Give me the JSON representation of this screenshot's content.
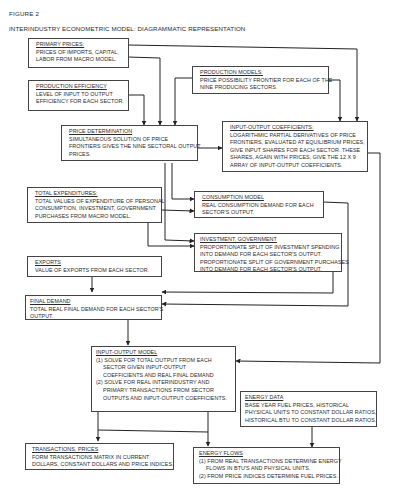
{
  "figure": {
    "label": "FIGURE 2",
    "title": "INTERINDUSTRY ECONOMETRIC MODEL: DIAGRAMMATIC REPRESENTATION"
  },
  "boxes": {
    "primary_prices": {
      "header": "PRIMARY PRICES:",
      "lines": [
        "PRICES OF IMPORTS, CAPITAL,",
        "LABOR FROM MACRO MODEL."
      ]
    },
    "production_efficiency": {
      "header": "PRODUCTION EFFICIENCY",
      "lines": [
        "LEVEL OF INPUT TO OUTPUT",
        "EFFICIENCY FOR EACH SECTOR."
      ]
    },
    "production_models": {
      "header": "PRODUCTION MODELS:",
      "lines": [
        "PRICE POSSIBILITY FRONTIER FOR EACH OF THE",
        "NINE PRODUCING SECTORS."
      ]
    },
    "price_determination": {
      "header": "PRICE DETERMINATION",
      "lines": [
        "SIMULTANEOUS SOLUTION OF PRICE",
        "FRONTIERS GIVES THE NINE SECTORAL OUTPUT",
        "PRICES."
      ]
    },
    "input_output_coefficients": {
      "header": "INPUT-OUTPUT COEFFICIENTS:",
      "lines": [
        "LOGARITHMIC PARTIAL DERIVATIVES OF PRICE",
        "FRONTIERS, EVALUATED AT EQUILIBRIUM PRICES,",
        "GIVE INPUT SHARES FOR EACH SECTOR. THESE",
        "SHARES, AGAIN WITH PRICES, GIVE THE 12 x 9",
        "ARRAY OF INPUT-OUTPUT COEFFICIENTS."
      ]
    },
    "total_expenditures": {
      "header": "TOTAL EXPENDITURES:",
      "lines": [
        "TOTAL VALUES OF EXPENDITURE OF PERSONAL",
        "CONSUMPTION, INVESTMENT, GOVERNMENT",
        "PURCHASES FROM MACRO MODEL."
      ]
    },
    "consumption_model": {
      "header": "CONSUMPTION MODEL",
      "lines": [
        "REAL CONSUMPTION DEMAND FOR EACH",
        "SECTOR'S OUTPUT."
      ]
    },
    "investment_government": {
      "header": "INVESTMENT, GOVERNMENT",
      "lines": [
        "PROPORTIONATE SPLIT OF INVESTMENT SPENDING",
        "INTO DEMAND FOR EACH SECTOR'S OUTPUT.",
        "PROPORTIONATE SPLIT OF GOVERNMENT PURCHASES",
        "INTO DEMAND FOR EACH SECTOR'S OUTPUT."
      ]
    },
    "exports": {
      "header": "EXPORTS",
      "lines": [
        "VALUE OF EXPORTS FROM EACH SECTOR."
      ]
    },
    "final_demand": {
      "header": "FINAL DEMAND",
      "lines": [
        "TOTAL REAL FINAL DEMAND FOR EACH SECTOR'S",
        "OUTPUT."
      ]
    },
    "input_output_model": {
      "header": "INPUT-OUTPUT MODEL",
      "lines": [
        "(1) SOLVE FOR TOTAL OUTPUT FROM EACH",
        "SECTOR GIVEN INPUT-OUTPUT",
        "COEFFICIENTS AND REAL FINAL DEMAND",
        "(2) SOLVE FOR REAL INTERINDUSTRY AND",
        "PRIMARY TRANSACTIONS FROM SECTOR",
        "OUTPUTS AND INPUT-OUTPUT COEFFICIENTS."
      ]
    },
    "energy_data": {
      "header": "ENERGY DATA",
      "lines": [
        "BASE YEAR FUEL PRICES, HISTORICAL",
        "PHYSICAL UNITS TO CONSTANT DOLLAR RATIOS,",
        "HISTORICAL BTU TO CONSTANT DOLLAR RATIOS."
      ]
    },
    "transactions_prices": {
      "header": "TRANSACTIONS, PRICES",
      "lines": [
        "FORM TRANSACTIONS MATRIX IN CURRENT",
        "DOLLARS, CONSTANT DOLLARS AND PRICE INDICES."
      ]
    },
    "energy_flows": {
      "header": "ENERGY FLOWS",
      "lines": [
        "(1) FROM REAL TRANSACTIONS DETERMINE ENERGY",
        "FLOWS IN BTU'S AND PHYSICAL UNITS.",
        "(2) FROM PRICE INDICES DETERMINE FUEL PRICES."
      ]
    }
  },
  "connections": [
    {
      "from": "primary_prices",
      "to": "price_determination"
    },
    {
      "from": "primary_prices",
      "to": "input_output_coefficients"
    },
    {
      "from": "production_efficiency",
      "to": "price_determination"
    },
    {
      "from": "production_models",
      "to": "price_determination"
    },
    {
      "from": "production_models",
      "to": "input_output_coefficients"
    },
    {
      "from": "price_determination",
      "to": "input_output_coefficients"
    },
    {
      "from": "price_determination",
      "to": "consumption_model"
    },
    {
      "from": "price_determination",
      "to": "investment_government"
    },
    {
      "from": "total_expenditures",
      "to": "consumption_model"
    },
    {
      "from": "total_expenditures",
      "to": "investment_government"
    },
    {
      "from": "consumption_model",
      "to": "final_demand"
    },
    {
      "from": "investment_government",
      "to": "final_demand"
    },
    {
      "from": "exports",
      "to": "final_demand"
    },
    {
      "from": "final_demand",
      "to": "input_output_model"
    },
    {
      "from": "input_output_coefficients",
      "to": "input_output_model"
    },
    {
      "from": "input_output_model",
      "to": "transactions_prices"
    },
    {
      "from": "input_output_model",
      "to": "energy_flows"
    },
    {
      "from": "energy_data",
      "to": "energy_flows"
    }
  ]
}
